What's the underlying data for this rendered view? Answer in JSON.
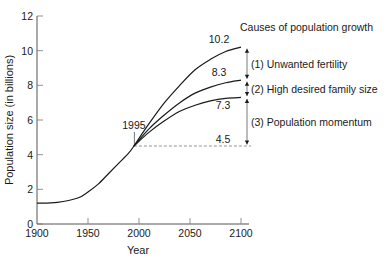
{
  "chart_data": {
    "type": "line",
    "title": "",
    "xlabel": "Year",
    "ylabel": "Population size (in billions)",
    "xlim": [
      1900,
      2100
    ],
    "ylim": [
      0,
      12
    ],
    "x_ticks": [
      1900,
      1950,
      2000,
      2050,
      2100
    ],
    "y_ticks": [
      0,
      2,
      4,
      6,
      8,
      10,
      12
    ],
    "grid": false,
    "historical": {
      "name": "Historical population",
      "x": [
        1900,
        1920,
        1940,
        1950,
        1960,
        1970,
        1980,
        1990,
        1995
      ],
      "values": [
        1.2,
        1.25,
        1.5,
        1.85,
        2.3,
        2.9,
        3.5,
        4.1,
        4.5
      ]
    },
    "series": [
      {
        "name": "Projection with unwanted fertility",
        "x": [
          1995,
          2010,
          2025,
          2040,
          2055,
          2070,
          2085,
          2100
        ],
        "values": [
          4.5,
          5.8,
          7.0,
          8.0,
          8.9,
          9.5,
          9.95,
          10.2
        ],
        "end_label": "10.2"
      },
      {
        "name": "Projection with high desired family size",
        "x": [
          1995,
          2010,
          2025,
          2040,
          2055,
          2070,
          2085,
          2100
        ],
        "values": [
          4.5,
          5.5,
          6.3,
          7.0,
          7.55,
          7.9,
          8.15,
          8.3
        ],
        "end_label": "8.3"
      },
      {
        "name": "Projection with population momentum only",
        "x": [
          1995,
          2010,
          2025,
          2040,
          2055,
          2070,
          2085,
          2100
        ],
        "values": [
          4.5,
          5.3,
          5.95,
          6.5,
          6.85,
          7.1,
          7.25,
          7.3
        ],
        "end_label": "7.3"
      }
    ],
    "baseline": {
      "value": 4.5,
      "label": "4.5",
      "style": "dashed",
      "from_x": 1995,
      "to_x": 2100
    },
    "annotations": [
      {
        "text": "1995",
        "x": 1995,
        "y": 4.5,
        "type": "marker-line"
      }
    ],
    "legend": {
      "title": "Causes of population growth",
      "position": "right",
      "items": [
        {
          "label": "(1) Unwanted fertility",
          "from": 8.3,
          "to": 10.2
        },
        {
          "label": "(2) High desired family size",
          "from": 7.3,
          "to": 8.3
        },
        {
          "label": "(3) Population momentum",
          "from": 4.5,
          "to": 7.3
        }
      ]
    }
  },
  "labels": {
    "ylabel": "Population size (in billions)",
    "xlabel": "Year",
    "legend_title": "Causes of population growth",
    "marker_year": "1995",
    "baseline_value": "4.5"
  },
  "colors": {
    "line": "#1a1a1a",
    "axis": "#555555",
    "dashed": "#777777",
    "text": "#1a1a1a"
  }
}
